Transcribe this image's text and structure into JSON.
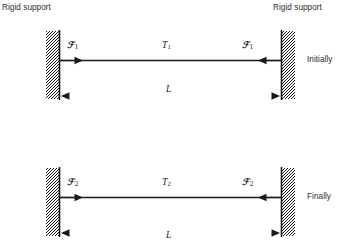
{
  "figure": {
    "title_top_left": "Rigid support",
    "title_top_right": "Rigid support",
    "panels": [
      {
        "state_label": "Initially",
        "force_left": {
          "symbol": "ℱ",
          "subscript": "1"
        },
        "force_right": {
          "symbol": "ℱ",
          "subscript": "1"
        },
        "temperature": {
          "symbol": "T",
          "subscript": "1"
        },
        "length": {
          "symbol": "L"
        }
      },
      {
        "state_label": "Finally",
        "force_left": {
          "symbol": "ℱ",
          "subscript": "2"
        },
        "force_right": {
          "symbol": "ℱ",
          "subscript": "2"
        },
        "temperature": {
          "symbol": "T",
          "subscript": "2"
        },
        "length": {
          "symbol": "L"
        }
      }
    ],
    "colors": {
      "ink": "#1a1a1a",
      "text": "#2b2b2b",
      "background": "#ffffff"
    }
  }
}
